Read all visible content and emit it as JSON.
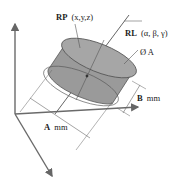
{
  "labels": {
    "rp_bold": "RP",
    "rp_coords": "(x,y,z)",
    "rl_bold": "RL",
    "rl_angles": "(α, β, γ)",
    "diameter": "Ø A",
    "b_bold": "B",
    "b_unit": "mm",
    "a_bold": "A",
    "a_unit": "mm"
  },
  "colors": {
    "cylinder_fill": "#9a9a9a",
    "cylinder_top": "#a8a8a8",
    "axis": "#6a6a6a",
    "line": "#555555"
  }
}
